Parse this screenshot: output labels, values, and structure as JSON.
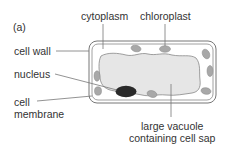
{
  "figure": {
    "panel_label": "(a)",
    "labels": {
      "cytoplasm": "cytoplasm",
      "chloroplast": "chloroplast",
      "cell_wall": "cell wall",
      "nucleus": "nucleus",
      "cell_membrane_line1": "cell",
      "cell_membrane_line2": "membrane",
      "vacuole_line1": "large vacuole",
      "vacuole_line2": "containing cell sap"
    }
  },
  "colors": {
    "outline": "#777777",
    "vacuole_fill": "#e6e6e6",
    "chloroplast_fill": "#a8a8a8",
    "nucleus_fill": "#2a2a2a",
    "text": "#333333"
  }
}
